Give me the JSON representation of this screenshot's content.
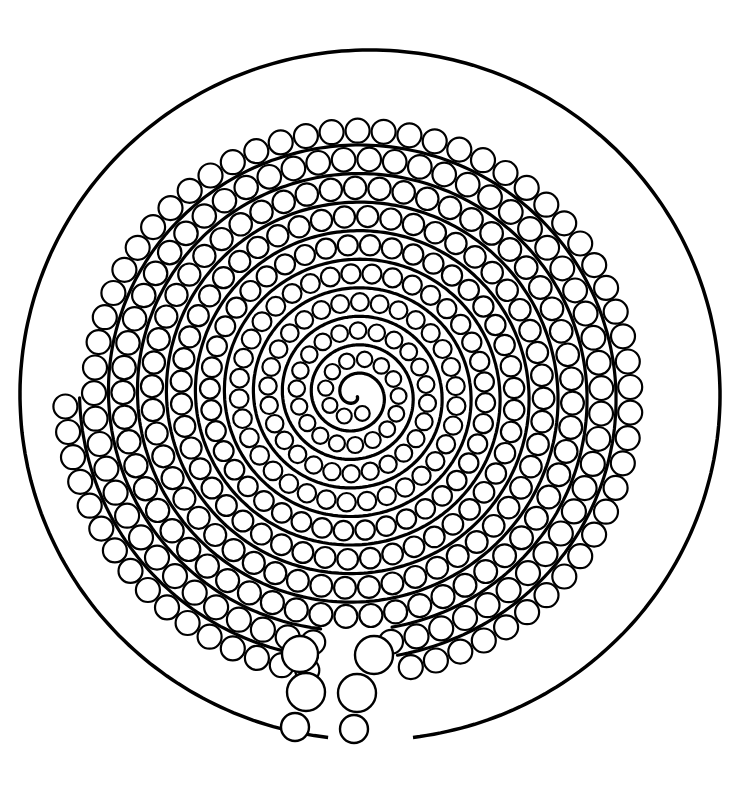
{
  "figure": {
    "colors": {
      "background": "#ffffff",
      "ink": "#000000",
      "fill": "#ffffff"
    },
    "outline": {
      "cx": 370,
      "cy": 395,
      "rx": 350,
      "ry": 345
    },
    "spiral": {
      "cx": 355,
      "cy": 395,
      "turns": 9.5,
      "lane_width": 29,
      "circle_radius": 12
    },
    "bottom_opening": {
      "left_circles": [
        {
          "cx": 300,
          "cy": 654,
          "r": 18
        },
        {
          "cx": 306,
          "cy": 692,
          "r": 19
        },
        {
          "cx": 295,
          "cy": 727,
          "r": 14
        }
      ],
      "right_circles": [
        {
          "cx": 374,
          "cy": 655,
          "r": 19
        },
        {
          "cx": 357,
          "cy": 693,
          "r": 19
        },
        {
          "cx": 354,
          "cy": 729,
          "r": 14
        }
      ]
    }
  }
}
